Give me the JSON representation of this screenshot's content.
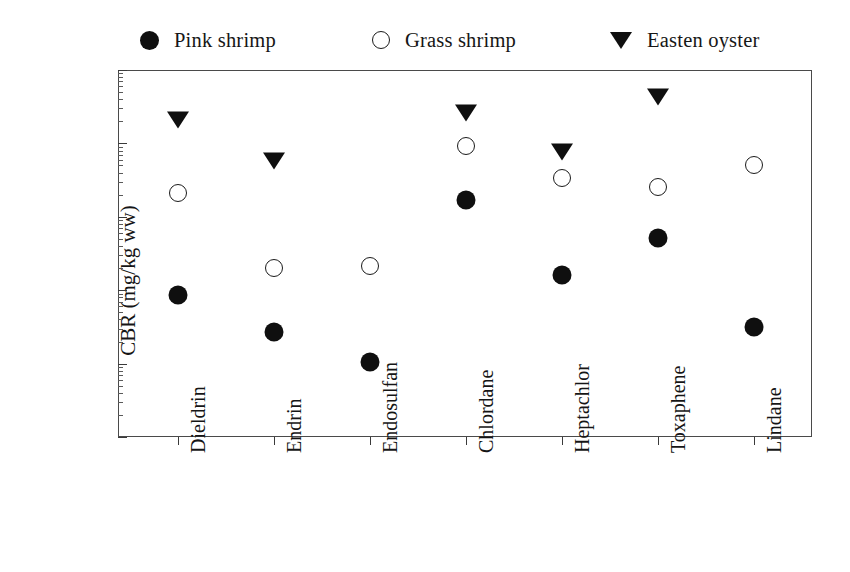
{
  "chart_data": {
    "type": "scatter",
    "title": "",
    "xlabel": "",
    "ylabel": "CBR (mg/kg ww)",
    "ylim": [
      0.001,
      100
    ],
    "yscale": "log",
    "grid": false,
    "legend_position": "top",
    "categories": [
      "Dieldrin",
      "Endrin",
      "Endosulfan",
      "Chlordane",
      "Heptachlor",
      "Toxaphene",
      "Lindane"
    ],
    "ytick_labels": [
      "100",
      "10",
      "1",
      "0.1",
      "0.01",
      "0.001"
    ],
    "ytick_values": [
      100,
      10,
      1,
      0.1,
      0.01,
      0.001
    ],
    "series": [
      {
        "name": "Pink shrimp",
        "marker": "filled-circle",
        "color": "#0f0f0f",
        "values": [
          0.08,
          0.025,
          0.01,
          1.6,
          0.15,
          0.48,
          0.03
        ]
      },
      {
        "name": "Grass shrimp",
        "marker": "open-circle",
        "color": "#1b1b1b",
        "values": [
          2.0,
          0.19,
          0.2,
          8.7,
          3.2,
          2.4,
          4.8
        ]
      },
      {
        "name": "Easten oyster",
        "marker": "filled-triangle-down",
        "color": "#0f0f0f",
        "values": [
          20,
          5.5,
          null,
          25,
          7.5,
          42,
          null
        ]
      }
    ]
  },
  "legend": {
    "items": [
      {
        "label": "Pink shrimp",
        "icon": "filled-circle-icon"
      },
      {
        "label": "Grass shrimp",
        "icon": "open-circle-icon"
      },
      {
        "label": "Easten oyster",
        "icon": "filled-triangle-down-icon"
      }
    ]
  },
  "axes": {
    "y_axis_label": "CBR (mg/kg ww)"
  }
}
